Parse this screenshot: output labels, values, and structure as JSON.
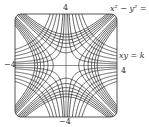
{
  "diagram": {
    "curve_families": [
      {
        "equation": "x² − y² = c",
        "label": "x² − y² = c"
      },
      {
        "equation": "xy = k",
        "label": "xy = k"
      }
    ],
    "axis_labels": {
      "top": "4",
      "bottom": "−4",
      "left": "−4",
      "right": "4"
    },
    "domain": {
      "xmin": -4,
      "xmax": 4,
      "ymin": -4,
      "ymax": 4
    },
    "colors": {
      "curve": "#222222",
      "frame": "#555555",
      "background": "#ffffff"
    }
  }
}
